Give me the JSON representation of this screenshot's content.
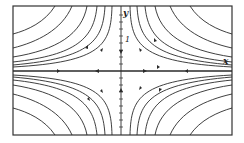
{
  "diagram": {
    "type": "phase-portrait",
    "axes": {
      "x_label": "x",
      "y_label": "y",
      "y_tick_label": "1"
    },
    "colors": {
      "line": "#2a2a2a",
      "frame": "#333333",
      "background": "#ffffff"
    }
  }
}
